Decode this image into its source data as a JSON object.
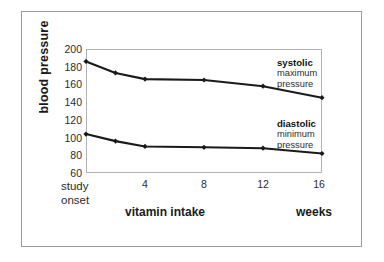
{
  "figure": {
    "background_color": "#ffffff",
    "frame_color": "#9a9a9a",
    "plot_border_color": "#b3b3b3",
    "line_color": "#1a1a1a"
  },
  "chart_data": {
    "type": "line",
    "title": "",
    "xlabel": "vitamin intake",
    "xunits": "weeks",
    "ylabel": "blood pressure",
    "x": [
      0,
      2,
      4,
      8,
      12,
      16
    ],
    "xlim": [
      0,
      16
    ],
    "ylim": [
      60,
      200
    ],
    "yticks": [
      200,
      180,
      160,
      140,
      120,
      100,
      80,
      60
    ],
    "xticks": [
      4,
      8,
      12,
      16
    ],
    "xtick_labels": [
      "4",
      "8",
      "12",
      "16"
    ],
    "ytick_labels": [
      "200",
      "180",
      "160",
      "140",
      "120",
      "100",
      "80",
      "60"
    ],
    "origin_label_line1": "study",
    "origin_label_line2": "onset",
    "grid": false,
    "legend_position": "inline-right",
    "marker": "diamond",
    "series": [
      {
        "name": "systolic",
        "description_line1": "maximum",
        "description_line2": "pressure",
        "values": [
          186,
          173,
          166,
          165,
          158,
          145
        ]
      },
      {
        "name": "diastolic",
        "description_line1": "minimum",
        "description_line2": "pressure",
        "values": [
          104,
          96,
          90,
          89,
          88,
          82
        ]
      }
    ]
  }
}
